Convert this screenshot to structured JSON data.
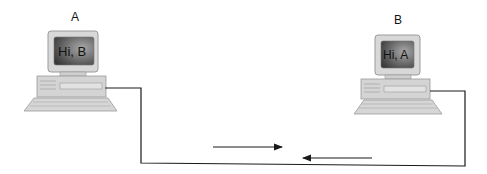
{
  "computers": [
    {
      "id": "A",
      "label": "A",
      "screen_text": "Hi, B"
    },
    {
      "id": "B",
      "label": "B",
      "screen_text": "Hi, A"
    }
  ],
  "arrows": [
    {
      "direction": "right"
    },
    {
      "direction": "left"
    }
  ],
  "colors": {
    "wire": "#1a1a1a",
    "device": "#c8c8c8",
    "device_edge": "#9a9a9a",
    "screen_dark": "#3a3a3a",
    "screen_light": "#9a9a9a"
  }
}
